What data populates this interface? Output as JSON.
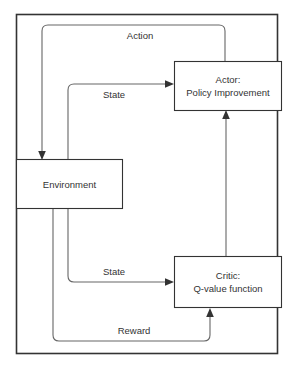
{
  "diagram": {
    "type": "flow-diagram",
    "colors": {
      "background": "#ffffff",
      "node_stroke": "#333333",
      "node_fill": "#ffffff",
      "edge_stroke": "#666666",
      "frame_stroke": "#333333",
      "text": "#333333"
    },
    "frame": {
      "name": "outer-frame"
    },
    "nodes": [
      {
        "id": "environment",
        "label_lines": [
          "Environment"
        ],
        "line1": "Environment",
        "line2": ""
      },
      {
        "id": "actor",
        "label_lines": [
          "Actor:",
          "Policy Improvement"
        ],
        "line1": "Actor:",
        "line2": "Policy Improvement"
      },
      {
        "id": "critic",
        "label_lines": [
          "Critic:",
          "Q-value function"
        ],
        "line1": "Critic:",
        "line2": "Q-value function"
      }
    ],
    "edges": [
      {
        "id": "action-edge",
        "label": "Action",
        "from": "actor",
        "to": "environment"
      },
      {
        "id": "state-to-actor-edge",
        "label": "State",
        "from": "environment",
        "to": "actor"
      },
      {
        "id": "state-to-critic-edge",
        "label": "State",
        "from": "environment",
        "to": "critic"
      },
      {
        "id": "reward-edge",
        "label": "Reward",
        "from": "environment",
        "to": "critic"
      },
      {
        "id": "critic-to-actor-edge",
        "label": "",
        "from": "critic",
        "to": "actor"
      }
    ]
  }
}
